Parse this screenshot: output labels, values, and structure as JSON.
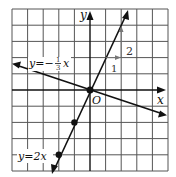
{
  "figure": {
    "grid": {
      "cells_x": 10,
      "cells_y": 10,
      "origin_col": 5,
      "origin_row": 5
    },
    "axes": {
      "x_label": "x",
      "y_label": "y",
      "origin_label": "O"
    },
    "lines": [
      {
        "label": "y = 2x",
        "label_text": "y=2x",
        "slope": 2,
        "points": [
          [
            0,
            0
          ],
          [
            -1,
            -2
          ],
          [
            -2,
            -4
          ]
        ]
      },
      {
        "label_prefix": "y=−",
        "fraction_num": "1",
        "fraction_den": "3",
        "label_suffix": "x",
        "slope": -0.3333
      }
    ],
    "slope_triangle": {
      "run_label": "1",
      "rise_label": "2"
    }
  },
  "colors": {
    "grid": "#444444",
    "ink": "#111111",
    "background": "#ffffff"
  }
}
